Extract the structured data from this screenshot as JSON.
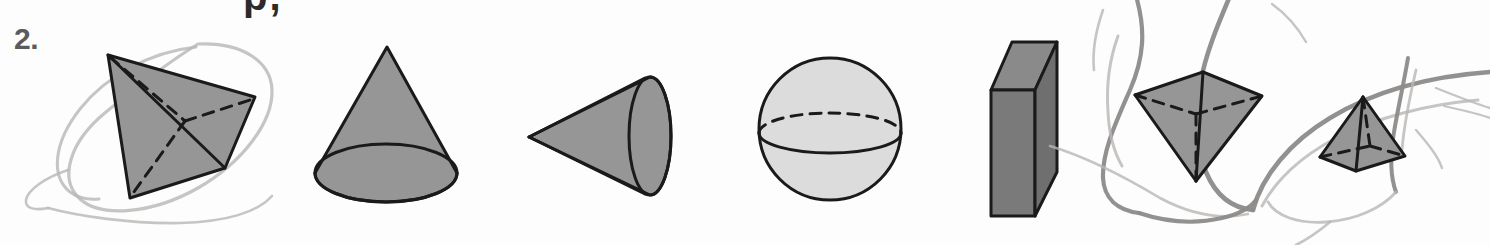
{
  "page": {
    "width": 1490,
    "height": 245,
    "background_color": "#fdfdfd",
    "question_number": "2.",
    "clipped_top_text": "p,"
  },
  "colors": {
    "ink": "#1a1a1a",
    "fill_medium_gray": "#969696",
    "fill_light_gray": "#dcdcdc",
    "fill_dark_gray": "#7a7a7a",
    "fill_dark_gray_top": "#8a8a8a",
    "question_number_gray": "#5b5b5b",
    "pencil_gray": "#9c9a98",
    "pencil_light_gray": "#b9b7b5"
  },
  "shapes": [
    {
      "id": "tetrahedron",
      "name": "Triangular pyramid (tetrahedron)",
      "index": 1,
      "fill": "#969696",
      "has_hidden_edges": true,
      "circled": true,
      "circle_style": "light pencil ellipse"
    },
    {
      "id": "cone-upright",
      "name": "Cone (upright, circular base)",
      "index": 2,
      "fill": "#969696",
      "has_hidden_edges": false,
      "circled": false
    },
    {
      "id": "cone-sideways",
      "name": "Cone (lying on side, apex pointing left)",
      "index": 3,
      "fill": "#969696",
      "has_hidden_edges": false,
      "circled": false
    },
    {
      "id": "sphere",
      "name": "Sphere with equator",
      "index": 4,
      "fill": "#dcdcdc",
      "has_hidden_edges": true,
      "circled": false
    },
    {
      "id": "rectangular-prism",
      "name": "Rectangular prism (cuboid)",
      "index": 5,
      "fill": "#7a7a7a",
      "has_hidden_edges": false,
      "circled": false
    },
    {
      "id": "pyramid-inverted",
      "name": "Square pyramid (inverted, apex down)",
      "index": 6,
      "fill": "#969696",
      "has_hidden_edges": true,
      "circled": true,
      "circle_style": "dark pencil loop"
    },
    {
      "id": "pyramid-upright",
      "name": "Square pyramid (upright, apex up)",
      "index": 7,
      "fill": "#969696",
      "has_hidden_edges": true,
      "circled": true,
      "circle_style": "dark pencil loop"
    }
  ]
}
